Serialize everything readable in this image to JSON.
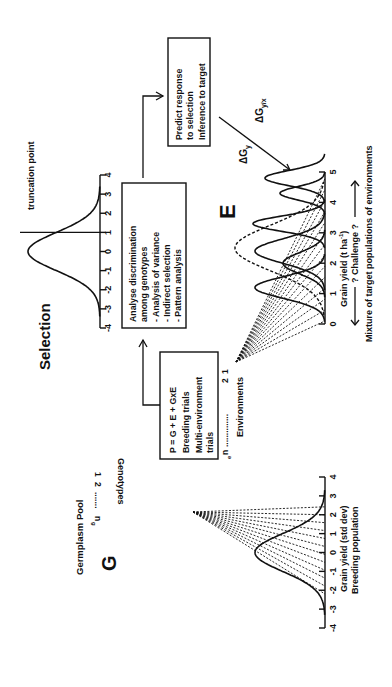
{
  "diagram": {
    "germplasm": {
      "title": "Germplasm Pool",
      "letter": "G",
      "genotypes_label": "Genotypes",
      "genotype_index_1": "1",
      "genotype_index_2": "2",
      "genotype_index_n": "n",
      "genotype_index_n_sub": "g",
      "axis_label": "Grain yield (std dev)",
      "axis_sublabel": "Breeding population",
      "ticks": [
        "-4",
        "-3",
        "-2",
        "-1",
        "0",
        "1",
        "2",
        "3",
        "4"
      ]
    },
    "trials_box": {
      "line1": "P = G + E + GxE",
      "line2": "Breeding trials",
      "line3": "Multi-environment",
      "line4": "trials"
    },
    "environments": {
      "label": "Environments",
      "index_1": "1",
      "index_2": "2",
      "index_n": "n",
      "index_n_sub": "e",
      "letter": "E",
      "axis_label": "Grain yield (t ha",
      "axis_label_sup": "-1",
      "axis_label_close": ")",
      "challenge": "? Challenge ?",
      "mixture": "Mixture of target populations of environments",
      "ticks": [
        "0",
        "1",
        "2",
        "3",
        "4",
        "5"
      ]
    },
    "analysis_box": {
      "line1": "Analyse discrimination",
      "line2": "among genotypes",
      "line3": "- Analysis of variance",
      "line4": "- Indirect selection",
      "line5": "- Pattern analysis"
    },
    "selection": {
      "title": "Selection",
      "truncation": "truncation point",
      "ticks": [
        "-4",
        "-3",
        "-2",
        "-1",
        "0",
        "1",
        "2",
        "3",
        "4"
      ]
    },
    "predict_box": {
      "line1": "Predict response",
      "line2": "to selection",
      "line3": "Inference to target"
    },
    "delta_gy": {
      "symbol": "ΔG",
      "sub": "y"
    },
    "delta_gyx": {
      "symbol": "ΔG",
      "sub": "y/x"
    }
  }
}
